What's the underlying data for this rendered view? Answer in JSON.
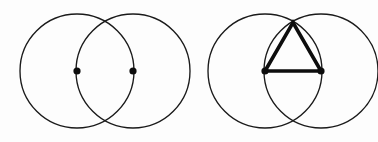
{
  "figure": {
    "canvas": {
      "width": 378,
      "height": 142,
      "background": "#fdfdfd"
    },
    "stroke_colors": {
      "circle": "#1a1a1a",
      "triangle": "#0d0d0d",
      "point": "#0d0d0d"
    },
    "line_widths": {
      "circle": 1.35,
      "triangle": 3.6
    },
    "panels": [
      {
        "name": "step-1-two-circles",
        "label": "",
        "circles": [
          {
            "name": "circle-left",
            "cx": 77,
            "cy": 71,
            "r": 57
          },
          {
            "name": "circle-right",
            "cx": 133,
            "cy": 71,
            "r": 57
          }
        ],
        "points": [
          {
            "name": "center-left",
            "label": "",
            "cx": 77,
            "cy": 71,
            "r": 3.6
          },
          {
            "name": "center-right",
            "label": "",
            "cx": 133,
            "cy": 71,
            "r": 3.6
          }
        ],
        "intersections": [
          {
            "name": "upper-intersection",
            "cx": 105,
            "cy": 21.4
          },
          {
            "name": "lower-intersection",
            "cx": 105,
            "cy": 120.6
          }
        ],
        "triangle": null
      },
      {
        "name": "step-2-triangle-added",
        "label": "",
        "circles": [
          {
            "name": "circle-left",
            "cx": 265,
            "cy": 71,
            "r": 57
          },
          {
            "name": "circle-right",
            "cx": 321,
            "cy": 71,
            "r": 57
          }
        ],
        "points": [
          {
            "name": "center-left",
            "label": "",
            "cx": 265,
            "cy": 71,
            "r": 3.6
          },
          {
            "name": "center-right",
            "label": "",
            "cx": 321,
            "cy": 71,
            "r": 3.6
          }
        ],
        "intersections": [
          {
            "name": "upper-intersection",
            "cx": 293,
            "cy": 21.4
          },
          {
            "name": "lower-intersection",
            "cx": 293,
            "cy": 120.6
          }
        ],
        "triangle": {
          "name": "equilateral-triangle",
          "vertices": [
            {
              "name": "vertex-bottom-left",
              "x": 265,
              "y": 71
            },
            {
              "name": "vertex-bottom-right",
              "x": 321,
              "y": 71
            },
            {
              "name": "vertex-apex",
              "x": 293,
              "y": 22.5
            }
          ],
          "side_length": 56
        }
      }
    ]
  }
}
